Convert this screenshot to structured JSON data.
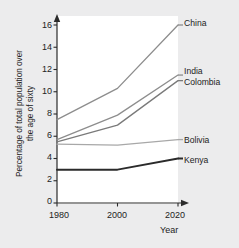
{
  "chart_data": {
    "type": "line",
    "title": "",
    "xlabel": "Year",
    "ylabel": "Percentage of total population over the age of sixty",
    "ylabel_line1": "Percentage of total population over",
    "ylabel_line2": "the age of sixty",
    "x": [
      1980,
      2000,
      2020
    ],
    "xtick_labels": [
      "1980",
      "2000",
      "2020"
    ],
    "ytick_labels": [
      "0",
      "2",
      "4",
      "6",
      "8",
      "10",
      "12",
      "14",
      "16"
    ],
    "yticks": [
      0,
      2,
      4,
      6,
      8,
      10,
      12,
      14,
      16
    ],
    "xlim": [
      1980,
      2020
    ],
    "ylim": [
      0,
      16
    ],
    "grid": false,
    "legend_position": "inline-right",
    "series": [
      {
        "name": "China",
        "values": [
          7.5,
          10.3,
          16.0
        ],
        "color": "#8d8d8d",
        "width": 1.3
      },
      {
        "name": "India",
        "values": [
          5.7,
          7.9,
          11.5
        ],
        "color": "#8d8d8d",
        "width": 1.3
      },
      {
        "name": "Colombia",
        "values": [
          5.5,
          7.0,
          11.0
        ],
        "color": "#7a7a7a",
        "width": 1.3
      },
      {
        "name": "Bolivia",
        "values": [
          5.3,
          5.2,
          5.7
        ],
        "color": "#a8a8a8",
        "width": 1.3
      },
      {
        "name": "Kenya",
        "values": [
          3.0,
          3.0,
          4.0
        ],
        "color": "#2b2b2b",
        "width": 2.0
      }
    ]
  },
  "axis": {
    "x_title": "Year",
    "y_title_line1": "Percentage of total population over",
    "y_title_line2": "the age of sixty"
  },
  "ticks": {
    "y": [
      "16",
      "14",
      "12",
      "10",
      "8",
      "6",
      "4",
      "2",
      "0"
    ],
    "x": [
      "1980",
      "2000",
      "2020"
    ]
  },
  "labels": {
    "china": "China",
    "india": "India",
    "colombia": "Colombia",
    "bolivia": "Bolivia",
    "kenya": "Kenya"
  },
  "colors": {
    "page_background": "#ececed",
    "plot_background": "#ffffff",
    "axis": "#2b2b2b",
    "china": "#8d8d8d",
    "india": "#8d8d8d",
    "colombia": "#7a7a7a",
    "bolivia": "#a8a8a8",
    "kenya": "#2b2b2b"
  }
}
